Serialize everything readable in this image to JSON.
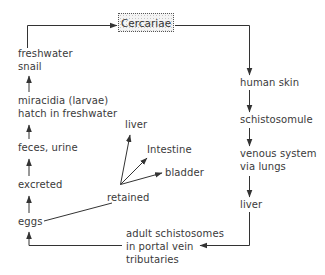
{
  "diagram": {
    "type": "life-cycle flowchart",
    "central_node": "Cercariae",
    "host_path": [
      "human skin",
      "schistosomule",
      "venous system\nvia lungs",
      "liver",
      "adult schistosomes\nin portal vein\ntributaries"
    ],
    "environment_path": [
      "eggs",
      "excreted",
      "feces, urine",
      "miracidia (larvae)\nhatch in freshwater",
      "freshwater\nsnail"
    ],
    "retained": {
      "label": "retained",
      "targets": [
        "liver",
        "Intestine",
        "bladder"
      ]
    }
  },
  "labels": {
    "cercariae": "Cercariae",
    "human_skin": "human skin",
    "schistosomule": "schistosomule",
    "venous_1": "venous system",
    "venous_2": "via lungs",
    "liver_right": "liver",
    "adult_1": "adult schistosomes",
    "adult_2": "in portal vein",
    "adult_3": "tributaries",
    "eggs": "eggs",
    "excreted": "excreted",
    "feces": "feces, urine",
    "miracidia_1": "miracidia (larvae)",
    "miracidia_2": "hatch in freshwater",
    "snail_1": "freshwater",
    "snail_2": "snail",
    "retained": "retained",
    "retained_liver": "liver",
    "retained_intestine": "Intestine",
    "retained_bladder": "bladder"
  },
  "colors": {
    "line": "#333333",
    "text": "#3a3a3a",
    "box_fill": "#f4f4f4"
  }
}
